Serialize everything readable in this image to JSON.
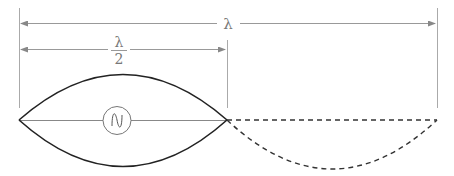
{
  "diagram": {
    "labels": {
      "full_wavelength": "λ",
      "half_wavelength_numerator": "λ",
      "half_wavelength_denominator": "2"
    },
    "source_icon": "ac-source-icon",
    "colors": {
      "dimension_lines": "#999999",
      "wave_solid": "#222222",
      "wave_dashed": "#333333",
      "background": "#ffffff"
    }
  }
}
